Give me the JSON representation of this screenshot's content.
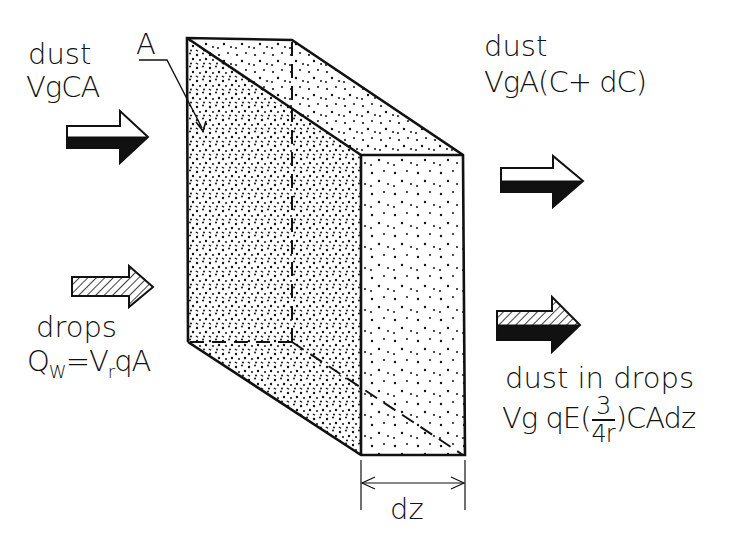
{
  "figure": {
    "type": "mass-balance schematic of a dust-scrubbing slab element",
    "colors": {
      "ink": "#111111",
      "background": "#ffffff"
    }
  },
  "labels": {
    "area": "A",
    "dust_in": {
      "title": "dust",
      "formula": "VgCA"
    },
    "dust_out": {
      "title": "dust",
      "formula": "VgA(C+ dC)"
    },
    "drops_in": {
      "title": "drops",
      "formula_q": "Q",
      "formula_q_sub": "W",
      "formula_rest_a": "=V",
      "formula_r_sub": "r",
      "formula_rest_b": "qA"
    },
    "dust_in_drops": {
      "title": "dust in drops",
      "formula_prefix": "Vg qE(",
      "frac_num": "3",
      "frac_den": "4r",
      "formula_suffix": ")CAdz"
    },
    "thickness": "dz"
  },
  "arrows": [
    {
      "id": "dust-in",
      "fill": "white-over-black"
    },
    {
      "id": "drops-in",
      "fill": "hatched"
    },
    {
      "id": "dust-out",
      "fill": "white-over-black"
    },
    {
      "id": "dust-in-drops-out",
      "fill": "hatched-over-black"
    }
  ]
}
